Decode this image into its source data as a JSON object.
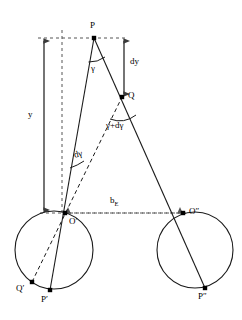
{
  "figure": {
    "background_color": "#ffffff",
    "stroke_color": "#000000",
    "width": 242,
    "height": 320
  },
  "points": {
    "P": {
      "label": "P",
      "x": 94,
      "y": 38,
      "label_x": 90,
      "label_y": 22
    },
    "Q": {
      "label": "Q",
      "x": 122,
      "y": 97,
      "label_x": 128,
      "label_y": 92
    },
    "O_prime": {
      "label": "O′",
      "x": 65,
      "y": 213,
      "label_x": 69,
      "label_y": 218
    },
    "O_double_prime": {
      "label": "O″",
      "x": 183,
      "y": 213,
      "label_x": 189,
      "label_y": 208
    },
    "Q_prime": {
      "label": "Q′",
      "x": 32,
      "y": 282,
      "label_x": 17,
      "label_y": 284
    },
    "P_prime": {
      "label": "P′",
      "x": 50,
      "y": 290,
      "label_x": 42,
      "label_y": 296
    },
    "P_double_prime": {
      "label": "P″",
      "x": 205,
      "y": 288,
      "label_x": 199,
      "label_y": 293
    }
  },
  "measures": {
    "y": {
      "label": "y",
      "label_x": 28,
      "label_y": 110
    },
    "dy": {
      "label": "dy",
      "label_x": 130,
      "label_y": 58
    },
    "b_E": {
      "label": "b",
      "subscript": "E",
      "label_x": 110,
      "label_y": 198
    }
  },
  "angles": {
    "gamma_at_P": {
      "label": "γ",
      "label_x": 92,
      "label_y": 65
    },
    "gamma_plus_dgamma_at_Q": {
      "label": "γ+dγ",
      "label_x": 107,
      "label_y": 122
    },
    "dgamma_at_O_prime": {
      "label": "dγ",
      "label_x": 74,
      "label_y": 152
    }
  },
  "circles": {
    "left": {
      "cx": 54,
      "cy": 250,
      "r": 39
    },
    "right": {
      "cx": 195,
      "cy": 250,
      "r": 38
    }
  }
}
